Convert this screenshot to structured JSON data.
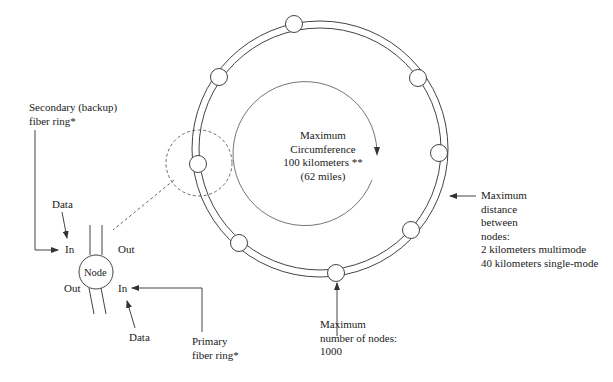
{
  "diagram": {
    "type": "FDDI dual ring topology",
    "ring": {
      "center": [
        320,
        149
      ],
      "outer_radius": 128,
      "inner_radius": 121,
      "node_radius": 8.5,
      "nodes": [
        {
          "id": "top",
          "x": 294,
          "y": 24
        },
        {
          "id": "upper-right",
          "x": 418,
          "y": 78
        },
        {
          "id": "right",
          "x": 439,
          "y": 153
        },
        {
          "id": "lower-right",
          "x": 411,
          "y": 230
        },
        {
          "id": "bottom",
          "x": 336,
          "y": 273
        },
        {
          "id": "lower-left",
          "x": 239,
          "y": 243
        },
        {
          "id": "left",
          "x": 198,
          "y": 164
        },
        {
          "id": "upper-left",
          "x": 219,
          "y": 77
        }
      ]
    },
    "center_label": {
      "line1": "Maximum",
      "line2": "Circumference",
      "line3": "100 kilometers **",
      "line4": "(62 miles)"
    },
    "secondary_ring_label": {
      "line1": "Secondary (backup)",
      "line2": "fiber ring*"
    },
    "primary_ring_label": {
      "line1": "Primary",
      "line2": "fiber ring*"
    },
    "max_distance_label": {
      "line1": "Maximum",
      "line2": "distance",
      "line3": "between",
      "line4": "nodes:",
      "line5": "2 kilometers multimode",
      "line6": "40 kilometers single-mode"
    },
    "max_nodes_label": {
      "line1": "Maximum",
      "line2": "number of nodes:",
      "line3": "1000"
    },
    "node_detail": {
      "node_label": "Node",
      "top_in": "In",
      "top_out": "Out",
      "bottom_out": "Out",
      "bottom_in": "In",
      "data_top": "Data",
      "data_bottom": "Data"
    },
    "colors": {
      "line": "#333333",
      "text": "#1a1a1a",
      "background": "#ffffff"
    }
  }
}
